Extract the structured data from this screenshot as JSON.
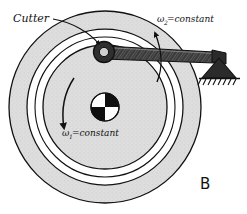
{
  "figure": {
    "label": "B"
  },
  "labels": {
    "cutter": "Cutter",
    "omega2_symbol": "ω",
    "omega2_subscript": "2",
    "omega2_value": "=constant",
    "omega1_symbol": "ω",
    "omega1_subscript": "1",
    "omega1_value": "=constant"
  },
  "colors": {
    "ink": "#111111",
    "disk_fill": "#dedede",
    "groove_fill": "#ffffff",
    "arm_fill": "#3a3a3a",
    "support_fill": "#2b2b2b",
    "hub_dark": "#101010",
    "hub_light": "#ffffff",
    "background": "#ffffff"
  },
  "geometry": {
    "disk_center_x": 105,
    "disk_center_y": 107,
    "outer_radius": 96,
    "groove_outer_radius": 78,
    "groove_inner_radius": 70,
    "inner_disk_radius": 62,
    "hub_radius": 14,
    "pivot_x": 104,
    "pivot_y": 52,
    "ground_pivot_x": 219,
    "ground_pivot_y": 59
  },
  "parts": {
    "disk_name": "rotating-disk",
    "groove_name": "annular-groove",
    "inner_disk_name": "inner-disk",
    "hub_name": "center-hub",
    "arm_name": "cutter-arm",
    "cutter_pivot_name": "cutter-bearing",
    "ground_support_name": "ground-pin-support"
  }
}
